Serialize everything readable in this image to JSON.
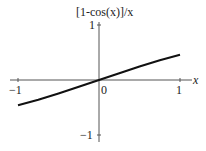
{
  "chart_data": {
    "type": "line",
    "title": "[1-cos(x)]/x",
    "xlabel": "x",
    "ylabel": "[1-cos(x)]/x",
    "xlim": [
      -1,
      1
    ],
    "ylim": [
      -1,
      1
    ],
    "x_ticks": [
      "-1",
      "0",
      "1"
    ],
    "y_ticks": [
      "1",
      "-1"
    ],
    "grid": false,
    "series": [
      {
        "name": "[1-cos(x)]/x",
        "x": [
          -1,
          -0.75,
          -0.5,
          -0.25,
          0,
          0.25,
          0.5,
          0.75,
          1
        ],
        "y": [
          -0.46,
          -0.36,
          -0.245,
          -0.124,
          0,
          0.124,
          0.245,
          0.36,
          0.46
        ]
      }
    ]
  },
  "labels": {
    "ylabel": "[1-cos(x)]/x",
    "xlabel": "x",
    "xtick_neg": "−1",
    "xtick_zero": "0",
    "xtick_pos": "1",
    "ytick_pos": "1",
    "ytick_neg": "−1"
  }
}
